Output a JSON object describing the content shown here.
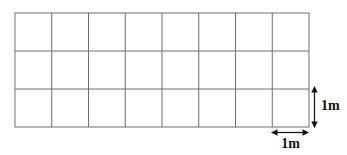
{
  "figure": {
    "type": "unit-square-grid-diagram",
    "grid": {
      "rows": 3,
      "columns": 8
    },
    "dimensions": {
      "height_label": "1m",
      "width_label": "1m"
    },
    "colors": {
      "background": "#ffffff",
      "grid_line": "#6e6e6e",
      "arrow": "#111111",
      "label_text": "#111111"
    }
  }
}
